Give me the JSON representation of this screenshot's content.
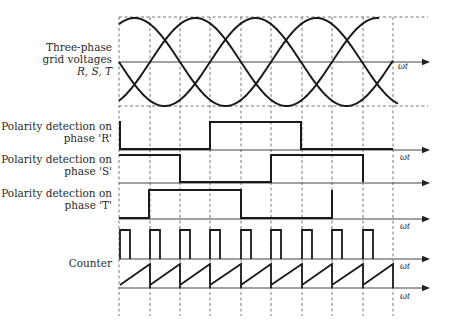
{
  "labels": {
    "voltages_line1": "Three-phase",
    "voltages_line2": "grid voltages",
    "voltages_line3": "R, S, T",
    "polarity_r_line1": "Polarity detection on",
    "polarity_r_line2": "phase 'R'",
    "polarity_s_line1": "Polarity detection on",
    "polarity_s_line2": "phase 'S'",
    "polarity_t_line1": "Polarity detection on",
    "polarity_t_line2": "phase 'T'",
    "counter": "Counter",
    "axis_label": "ωt"
  },
  "colors": {
    "stroke": "#1a1a1a",
    "grid": "#555555",
    "text": "#2a2a2a"
  },
  "grid": {
    "vertical_lines_x": [
      119,
      150,
      180,
      210,
      241,
      271,
      302,
      332,
      363,
      393
    ],
    "top_y": 17,
    "bottom_y": 106,
    "line_bottom_y": 316,
    "right_x": 428
  },
  "waveforms": {
    "voltages": {
      "axis_y": 62,
      "amplitude": 44,
      "period_px": 182,
      "x_start": 119,
      "phases": [
        {
          "name": "R",
          "peak_x": 134.5,
          "x_end": 398
        },
        {
          "name": "S",
          "peak_x": 195.5,
          "x_end": 379
        },
        {
          "name": "T",
          "peak_x": 73.5,
          "x_end": 393
        }
      ]
    },
    "polarity_r": {
      "axis_y": 150,
      "high_y": 122,
      "transitions": [
        [
          119,
          1
        ],
        [
          120,
          0
        ],
        [
          210,
          1
        ],
        [
          301,
          0
        ]
      ],
      "x_end": 393
    },
    "polarity_s": {
      "axis_y": 183,
      "high_y": 155,
      "transitions": [
        [
          119,
          1
        ],
        [
          180,
          0
        ],
        [
          271,
          1
        ],
        [
          363,
          0
        ]
      ],
      "x_end": 363
    },
    "polarity_t": {
      "axis_y": 219,
      "high_y": 190,
      "transitions": [
        [
          119,
          0
        ],
        [
          149,
          1
        ],
        [
          241,
          0
        ],
        [
          332,
          1
        ]
      ],
      "x_end": 332
    },
    "pulses": {
      "axis_y": 259,
      "high_y": 230,
      "starts_x": [
        120,
        150,
        180,
        210,
        241,
        271,
        302,
        332,
        363
      ],
      "width": 10
    },
    "counter": {
      "axis_y": 288,
      "top_y": 264,
      "low_y": 285,
      "resets_x": [
        120,
        150,
        180,
        210,
        241,
        271,
        302,
        332,
        363,
        393
      ]
    }
  },
  "axes": {
    "arrow_tip_x": 430,
    "wt_labels": [
      {
        "x": 398,
        "y": 60
      },
      {
        "x": 400,
        "y": 151
      },
      {
        "x": 400,
        "y": 220
      },
      {
        "x": 400,
        "y": 260
      },
      {
        "x": 400,
        "y": 290
      }
    ]
  }
}
